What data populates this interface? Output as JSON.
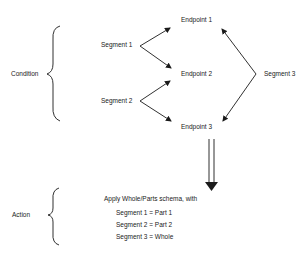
{
  "condition": {
    "label": "Condition",
    "segments": [
      {
        "label": "Segment 1"
      },
      {
        "label": "Segment 2"
      },
      {
        "label": "Segment 3"
      }
    ],
    "endpoints": [
      {
        "label": "Endpoint 1"
      },
      {
        "label": "Endpoint 2"
      },
      {
        "label": "Endpoint 3"
      }
    ]
  },
  "action": {
    "label": "Action",
    "title": "Apply Whole/Parts schema, with",
    "assignments": [
      {
        "text": "Segment 1 = Part 1"
      },
      {
        "text": "Segment 2 = Part 2"
      },
      {
        "text": "Segment 3 = Whole"
      }
    ]
  },
  "colors": {
    "ink": "#1a1a1a",
    "background": "#ffffff"
  }
}
